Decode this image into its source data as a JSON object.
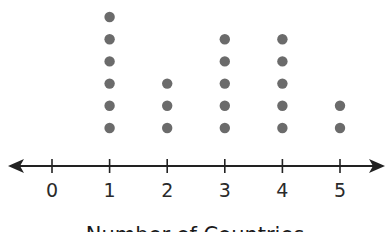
{
  "chart_data": {
    "type": "dot plot",
    "title": "",
    "xlabel": "Number of Countries",
    "ylabel": "",
    "categories": [
      "0",
      "1",
      "2",
      "3",
      "4",
      "5"
    ],
    "values": [
      0,
      6,
      3,
      5,
      5,
      2
    ],
    "xlim": [
      0,
      5
    ],
    "grid": false,
    "legend": null,
    "axis_arrows": "both ends"
  },
  "colors": {
    "dot": "#6b6b6b",
    "axis": "#222222",
    "text": "#2a2a2a"
  }
}
